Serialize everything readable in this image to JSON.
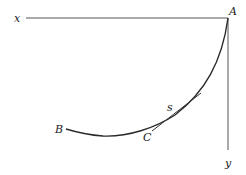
{
  "diagram": {
    "type": "brachistochrone-style curve diagram",
    "labels": {
      "x_axis": "x",
      "y_axis": "y",
      "point_a": "A",
      "point_b": "B",
      "point_c": "C",
      "arc_length": "s"
    },
    "geometry": {
      "origin_A": [
        228,
        18
      ],
      "x_axis_end": [
        26,
        18
      ],
      "y_axis_end": [
        228,
        150
      ],
      "curve_start_B": [
        66,
        129
      ],
      "curve_end_A": [
        228,
        18
      ],
      "tangent_line": [
        [
          152,
          131
        ],
        [
          201,
          93
        ]
      ]
    },
    "colors": {
      "background": "#ffffff",
      "lines": "#555555",
      "curve": "#2a2a2a",
      "text": "#222222"
    }
  }
}
